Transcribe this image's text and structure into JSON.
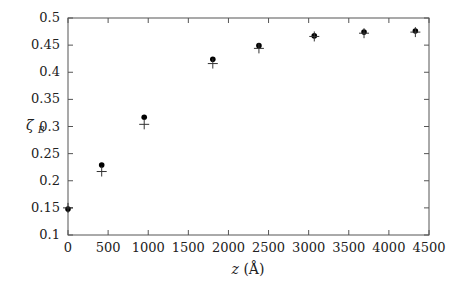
{
  "chart_data": {
    "type": "scatter",
    "title": "",
    "xlabel": "z (Å)",
    "ylabel": "ζB",
    "xlim": [
      0,
      4500
    ],
    "ylim": [
      0.1,
      0.5
    ],
    "x_ticks": [
      0,
      500,
      1000,
      1500,
      2000,
      2500,
      3000,
      3500,
      4000,
      4500
    ],
    "y_ticks": [
      0.1,
      0.15,
      0.2,
      0.25,
      0.3,
      0.35,
      0.4,
      0.45,
      0.5
    ],
    "x_tick_labels": [
      "0",
      "500",
      "1000",
      "1500",
      "2000",
      "2500",
      "3000",
      "3500",
      "4000",
      "4500"
    ],
    "y_tick_labels": [
      "0.1",
      "0.15",
      "0.2",
      "0.25",
      "0.3",
      "0.35",
      "0.4",
      "0.45",
      "0.5"
    ],
    "grid": false,
    "legend": null,
    "series": [
      {
        "name": "dots",
        "marker": "filled-circle",
        "x": [
          0,
          420,
          950,
          1805,
          2380,
          3070,
          3690,
          4330
        ],
        "y": [
          0.148,
          0.229,
          0.317,
          0.424,
          0.449,
          0.467,
          0.474,
          0.476
        ]
      },
      {
        "name": "crosses",
        "marker": "plus",
        "x": [
          0,
          420,
          950,
          1805,
          2380,
          3070,
          3690,
          4330
        ],
        "y": [
          0.15,
          0.217,
          0.304,
          0.416,
          0.444,
          0.466,
          0.472,
          0.474
        ]
      }
    ]
  },
  "axes": {
    "xlabel_italic": "z",
    "xlabel_unit": "(Å)",
    "ylabel_main": "ζ",
    "ylabel_sub": "B"
  }
}
